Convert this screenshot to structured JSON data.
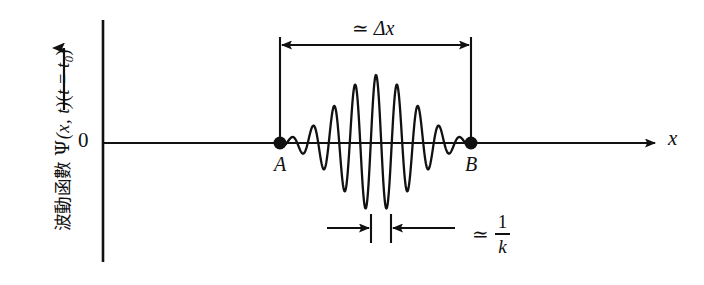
{
  "figure": {
    "background_color": "#ffffff",
    "ink_color": "#111111",
    "width": 704,
    "height": 285
  },
  "axes": {
    "y_caption_cjk": "波動函數",
    "y_caption_math_psi": "Ψ",
    "y_caption_math_args": "(x, t)",
    "y_caption_math_cond_open": "(",
    "y_caption_math_cond_var": "t",
    "y_caption_math_cond_eq": " = ",
    "y_caption_math_cond_t": "t",
    "y_caption_math_cond_sub": "0",
    "y_caption_math_cond_close": ")",
    "y_caption_full": "波動函數 Ψ(x, t)(t = t0)",
    "origin_label": "0",
    "x_axis_label": "x",
    "y_axis_x_px": 103,
    "y_axis_top_px": 20,
    "y_axis_bottom_px": 262,
    "x_axis_y_px": 143,
    "x_axis_left_px": 103,
    "x_axis_right_px": 662
  },
  "markers": {
    "point_a_label": "A",
    "point_b_label": "B",
    "point_a_x_px": 280,
    "point_b_x_px": 471,
    "point_y_px": 143,
    "dot_radius_px": 6.5
  },
  "annotations": {
    "delta_x": {
      "approx_symbol": "≃",
      "text": "Δx",
      "full": "≃ Δx",
      "arrow_y_px": 45,
      "arrow_left_px": 280,
      "arrow_right_px": 471,
      "tick_top_px": 37,
      "tick_bottom_px": 143
    },
    "one_over_k": {
      "approx_symbol": "≃",
      "numerator": "1",
      "denominator": "k",
      "full": "≃ 1/k",
      "arrow_y_px": 228,
      "tick_left_px": 371,
      "tick_right_px": 391,
      "tick_top_px": 214,
      "tick_bottom_px": 243,
      "arrow_in_left_start_px": 327,
      "arrow_in_right_end_px": 455
    }
  },
  "chart_data": {
    "type": "line",
    "title": "",
    "xlabel": "x",
    "ylabel": "波動函數 Ψ(x, t)(t = t0)",
    "grid": false,
    "legend": null,
    "envelope": {
      "form": "gaussian",
      "center_px": 376,
      "sigma_px": 38,
      "peak_amplitude_px": 68
    },
    "wave": {
      "wavelength_px": 21,
      "phase_deg": 0,
      "n_visible_oscillations": 9,
      "x_start_px": 280,
      "x_end_px": 471,
      "baseline_y_px": 143
    },
    "series": [
      {
        "name": "wave packet",
        "x": [
          280,
          287,
          294,
          301,
          308,
          315,
          322,
          329,
          336,
          343,
          350,
          357,
          364,
          371,
          376,
          381,
          388,
          395,
          402,
          409,
          416,
          423,
          430,
          437,
          444,
          451,
          458,
          465,
          471
        ],
        "y_amplitude_px": [
          0.3,
          1.5,
          4,
          7,
          12,
          19,
          27,
          36,
          45,
          54,
          61,
          66,
          68,
          67,
          68,
          67,
          68,
          66,
          61,
          54,
          45,
          36,
          27,
          19,
          12,
          7,
          4,
          1.5,
          0.3
        ]
      }
    ]
  }
}
